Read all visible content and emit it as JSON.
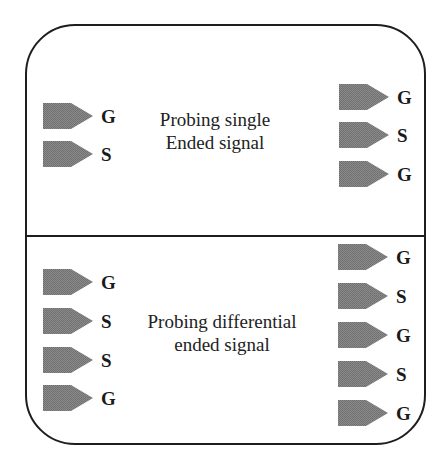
{
  "colors": {
    "border": "#1e1e1e",
    "probe_fill": "#7f7f7f",
    "text": "#222222"
  },
  "top_panel": {
    "caption_line1": "Probing single",
    "caption_line2": "Ended signal",
    "left_probes": [
      {
        "label": "G",
        "x": 43,
        "y": 103
      },
      {
        "label": "S",
        "x": 43,
        "y": 141
      }
    ],
    "right_probes": [
      {
        "label": "G",
        "x": 339,
        "y": 84
      },
      {
        "label": "S",
        "x": 339,
        "y": 122
      },
      {
        "label": "G",
        "x": 339,
        "y": 161
      }
    ]
  },
  "bottom_panel": {
    "caption_line1": "Probing differential",
    "caption_line2": "ended signal",
    "left_probes": [
      {
        "label": "G",
        "x": 43,
        "y": 269
      },
      {
        "label": "S",
        "x": 43,
        "y": 308
      },
      {
        "label": "S",
        "x": 43,
        "y": 347
      },
      {
        "label": "G",
        "x": 43,
        "y": 385
      }
    ],
    "right_probes": [
      {
        "label": "G",
        "x": 338,
        "y": 244
      },
      {
        "label": "S",
        "x": 338,
        "y": 283
      },
      {
        "label": "G",
        "x": 338,
        "y": 322
      },
      {
        "label": "S",
        "x": 338,
        "y": 361
      },
      {
        "label": "G",
        "x": 338,
        "y": 400
      }
    ]
  }
}
